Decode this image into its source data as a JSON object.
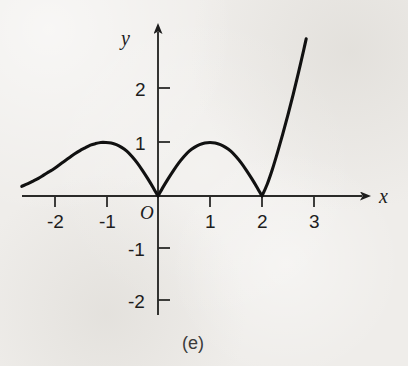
{
  "figure": {
    "caption": "(e)",
    "background_color": "#efedea",
    "ink_color": "#1d1d1d"
  },
  "chart_data": {
    "type": "line",
    "title": "",
    "subtitle": "",
    "xlabel": "x",
    "ylabel": "y",
    "origin_label": "O",
    "grid": false,
    "legend": "none",
    "xlim": [
      -2.62,
      3.45
    ],
    "ylim": [
      -2.3,
      3.05
    ],
    "xticks": [
      -2,
      -1,
      1,
      2,
      3
    ],
    "xtick_labels": [
      "-2",
      "-1",
      "1",
      "2",
      "3"
    ],
    "yticks": [
      2,
      1,
      -1,
      -2
    ],
    "ytick_labels": [
      "2",
      "1",
      "-1",
      "-2"
    ],
    "x_axis_arrow": true,
    "y_axis_arrow": true,
    "annotations": [
      "cusp at x = 0",
      "cusp at x = 2",
      "local maximum (-1, 1)",
      "local maximum (1, 1)"
    ],
    "series": [
      {
        "name": "curve",
        "x": [
          -2.62,
          -2.5,
          -2.4,
          -2.3,
          -2.2,
          -2.1,
          -2.0,
          -1.9,
          -1.8,
          -1.7,
          -1.6,
          -1.5,
          -1.4,
          -1.3,
          -1.2,
          -1.1,
          -1.0,
          -0.9,
          -0.8,
          -0.7,
          -0.6,
          -0.5,
          -0.4,
          -0.3,
          -0.2,
          -0.1,
          0.0,
          0.1,
          0.2,
          0.3,
          0.4,
          0.5,
          0.6,
          0.7,
          0.8,
          0.9,
          1.0,
          1.1,
          1.2,
          1.3,
          1.4,
          1.5,
          1.6,
          1.7,
          1.8,
          1.9,
          2.0,
          2.1,
          2.2,
          2.3,
          2.4,
          2.5,
          2.6,
          2.7,
          2.8,
          2.85
        ],
        "y": [
          0.18,
          0.23,
          0.28,
          0.33,
          0.39,
          0.45,
          0.51,
          0.58,
          0.65,
          0.72,
          0.79,
          0.85,
          0.9,
          0.95,
          0.98,
          1.0,
          1.0,
          0.99,
          0.96,
          0.91,
          0.84,
          0.74,
          0.62,
          0.48,
          0.33,
          0.17,
          0.0,
          0.17,
          0.33,
          0.48,
          0.62,
          0.74,
          0.84,
          0.91,
          0.96,
          0.99,
          1.0,
          0.99,
          0.96,
          0.91,
          0.84,
          0.74,
          0.62,
          0.48,
          0.33,
          0.17,
          0.0,
          0.22,
          0.5,
          0.82,
          1.16,
          1.52,
          1.9,
          2.3,
          2.72,
          2.94
        ]
      }
    ]
  }
}
